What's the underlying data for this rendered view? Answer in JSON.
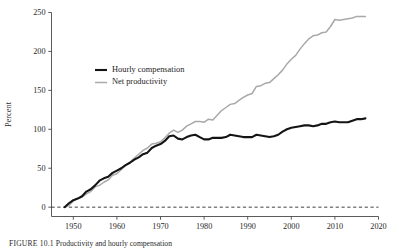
{
  "figure": {
    "caption_lead": "FIGURE 10.1",
    "caption_text": "Productivity and hourly compensation"
  },
  "chart_data": {
    "type": "line",
    "title": "",
    "subtitle": "",
    "xlabel": "",
    "ylabel": "Percent",
    "xlim": [
      1945,
      2020
    ],
    "ylim": [
      -12,
      250
    ],
    "grid": false,
    "legend_position": "inside-upper-left",
    "x_ticks": [
      1950,
      1960,
      1970,
      1980,
      1990,
      2000,
      2010,
      2020
    ],
    "x_tick_labels": [
      "1950",
      "1960",
      "1970",
      "1980",
      "1990",
      "2000",
      "2010",
      "2020"
    ],
    "y_ticks": [
      0,
      50,
      100,
      150,
      200,
      250
    ],
    "y_tick_labels": [
      "0",
      "50",
      "100",
      "150",
      "200",
      "250"
    ],
    "reference_line": {
      "value": 0,
      "style": "dashed"
    },
    "x": [
      1948,
      1949,
      1950,
      1951,
      1952,
      1953,
      1954,
      1955,
      1956,
      1957,
      1958,
      1959,
      1960,
      1961,
      1962,
      1963,
      1964,
      1965,
      1966,
      1967,
      1968,
      1969,
      1970,
      1971,
      1972,
      1973,
      1974,
      1975,
      1976,
      1977,
      1978,
      1979,
      1980,
      1981,
      1982,
      1983,
      1984,
      1985,
      1986,
      1987,
      1988,
      1989,
      1990,
      1991,
      1992,
      1993,
      1994,
      1995,
      1996,
      1997,
      1998,
      1999,
      2000,
      2001,
      2002,
      2003,
      2004,
      2005,
      2006,
      2007,
      2008,
      2009,
      2010,
      2011,
      2012,
      2013,
      2014,
      2015,
      2016,
      2017
    ],
    "series": [
      {
        "name": "Hourly compensation",
        "color": "#141414",
        "values": [
          0,
          5,
          9,
          11,
          14,
          20,
          23,
          28,
          34,
          37,
          39,
          44,
          47,
          50,
          54,
          57,
          61,
          64,
          68,
          70,
          76,
          79,
          81,
          85,
          91,
          92,
          88,
          87,
          90,
          92,
          93,
          90,
          87,
          87,
          89,
          89,
          89,
          90,
          93,
          92,
          91,
          90,
          90,
          90,
          93,
          92,
          91,
          90,
          91,
          93,
          97,
          100,
          102,
          103,
          104,
          105,
          105,
          104,
          105,
          107,
          107,
          109,
          110,
          109,
          109,
          109,
          111,
          113,
          113,
          114
        ]
      },
      {
        "name": "Net productivity",
        "color": "#a9a9a9",
        "values": [
          0,
          2,
          8,
          11,
          13,
          17,
          20,
          26,
          28,
          32,
          35,
          41,
          43,
          48,
          54,
          58,
          63,
          68,
          73,
          76,
          81,
          82,
          84,
          89,
          95,
          99,
          96,
          99,
          104,
          107,
          110,
          110,
          109,
          113,
          112,
          118,
          124,
          128,
          132,
          133,
          137,
          141,
          144,
          146,
          155,
          156,
          159,
          160,
          165,
          170,
          176,
          184,
          190,
          195,
          203,
          210,
          216,
          220,
          221,
          224,
          225,
          232,
          241,
          240,
          241,
          242,
          243,
          245,
          245,
          245
        ]
      }
    ],
    "legend": [
      {
        "label": "Hourly compensation",
        "color": "#141414",
        "weight": "thick"
      },
      {
        "label": "Net productivity",
        "color": "#a9a9a9",
        "weight": "thin"
      }
    ]
  }
}
